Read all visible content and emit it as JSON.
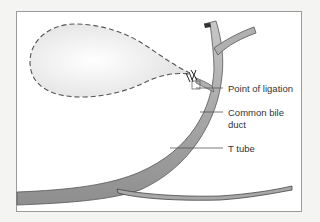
{
  "diagram": {
    "title": "",
    "labels": {
      "ligation": "Point of ligation",
      "cbd_line1": "Common bile",
      "cbd_line2": "duct",
      "t_tube": "T tube"
    },
    "structures": [
      "gallbladder (removed, dashed outline)",
      "cystic duct ligature",
      "hepatic duct branches",
      "common bile duct",
      "T tube"
    ],
    "colors": {
      "duct_fill": "#b0b0b0",
      "duct_stroke": "#555555",
      "dashed_outline": "#555555",
      "leader_line": "#555555",
      "label_text": "#333333",
      "frame_border": "#9a9a9a"
    }
  }
}
